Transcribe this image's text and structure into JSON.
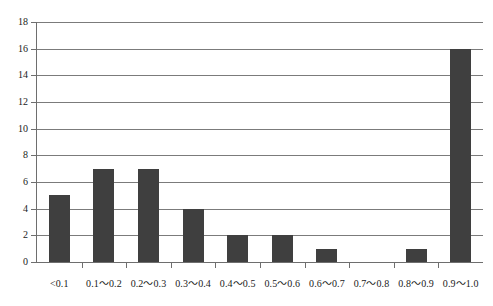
{
  "chart_data": {
    "type": "bar",
    "title": "",
    "subtitle": "",
    "xlabel": "",
    "ylabel": "",
    "categories": [
      "<0.1",
      "0.1〜0.2",
      "0.2〜0.3",
      "0.3〜0.4",
      "0.4〜0.5",
      "0.5〜0.6",
      "0.6〜0.7",
      "0.7〜0.8",
      "0.8〜0.9",
      "0.9〜1.0"
    ],
    "values": [
      5,
      7,
      7,
      4,
      2,
      2,
      1,
      0,
      1,
      16
    ],
    "ylim": [
      0,
      18
    ],
    "ytick_labels": [
      "18",
      "16",
      "14",
      "12",
      "10",
      "8",
      "6",
      "4",
      "2",
      "0"
    ],
    "ytick_values": [
      18,
      16,
      14,
      12,
      10,
      8,
      6,
      4,
      2,
      0
    ],
    "ytick_step": 2,
    "grid": true,
    "grid_axis": "y",
    "legend": null,
    "legend_position": "none",
    "bar_color": "#3f3f3f",
    "grid_color": "#7b7b7b",
    "axis_color": "#6e6e6e",
    "background_color": "#ffffff"
  }
}
